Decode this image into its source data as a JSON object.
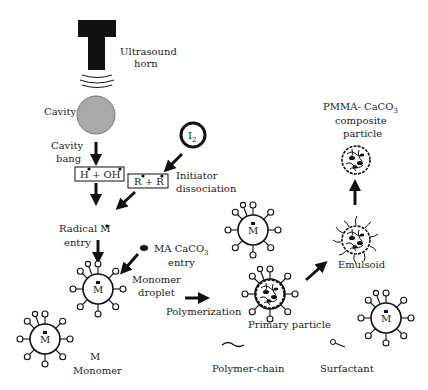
{
  "labels": {
    "ultrasound_1": "Ultrasound",
    "ultrasound_2": "horn",
    "cavity": "Cavity",
    "cavity_bang_1": "Cavity",
    "cavity_bang_2": "bang",
    "h_oh": "H + OH",
    "i2_main": "I",
    "i2_sub": "2",
    "r_r": "R + R",
    "initiator_1": "Initiator",
    "initiator_2": "dissociation",
    "radical_1": "Radical M",
    "radical_2": "entry",
    "maca_1": "MA CaCO",
    "maca_sub": "3",
    "maca_2": "entry",
    "monomer_droplet_1": "Monomer",
    "monomer_droplet_2": "droplet",
    "polymerization": "Polymerization",
    "primary_particle": "Primary particle",
    "emulsoid": "Emulsoid",
    "composite_1": "PMMA- CaCO",
    "composite_sub": "3",
    "composite_2": "composite",
    "composite_3": "particle",
    "droplet_m": "M",
    "legend_m": "M",
    "legend_monomer": "Monomer",
    "legend_polymer_chain": "Polymer-chain",
    "legend_surfactant": "Surfactant"
  },
  "colors": {
    "ink": "#111111",
    "cavity_fill": "#a9a9a9",
    "background": "#ffffff"
  }
}
